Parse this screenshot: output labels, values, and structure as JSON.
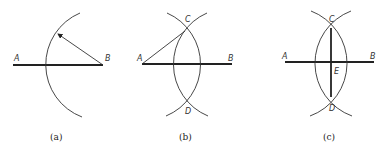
{
  "diagram": {
    "panels": [
      {
        "caption": "(a)",
        "points": {
          "A": "A",
          "B": "B"
        }
      },
      {
        "caption": "(b)",
        "points": {
          "A": "A",
          "B": "B",
          "C": "C",
          "D": "D"
        }
      },
      {
        "caption": "(c)",
        "points": {
          "A": "A",
          "B": "B",
          "C": "C",
          "D": "D",
          "E": "E"
        }
      }
    ]
  }
}
